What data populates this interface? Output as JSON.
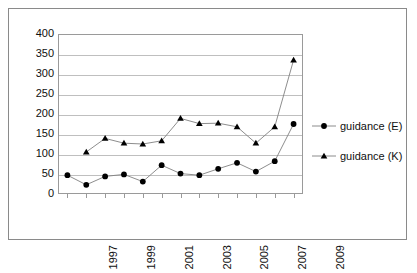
{
  "chart_data": {
    "type": "line",
    "title": "",
    "subtitle": "",
    "xlabel": "",
    "ylabel": "",
    "x": [
      1997,
      1998,
      1999,
      2000,
      2001,
      2002,
      2003,
      2004,
      2005,
      2006,
      2007,
      2008,
      2009
    ],
    "categories": [
      "1997",
      "1998",
      "1999",
      "2000",
      "2001",
      "2002",
      "2003",
      "2004",
      "2005",
      "2006",
      "2007",
      "2008",
      "2009"
    ],
    "xtick_labels": [
      "1997",
      "1999",
      "2001",
      "2003",
      "2005",
      "2007",
      "2009"
    ],
    "xtick_values": [
      1997,
      1999,
      2001,
      2003,
      2005,
      2007,
      2009
    ],
    "ytick_labels": [
      "0",
      "50",
      "100",
      "150",
      "200",
      "250",
      "300",
      "350",
      "400"
    ],
    "ytick_values": [
      0,
      50,
      100,
      150,
      200,
      250,
      300,
      350,
      400
    ],
    "ylim": [
      0,
      400
    ],
    "xlim": [
      1996.5,
      2009.5
    ],
    "grid": "horizontal",
    "legend_position": "right",
    "series": [
      {
        "name": "guidance (E)",
        "marker": "circle",
        "color": "#000000",
        "line_color": "#808080",
        "values": [
          47,
          23,
          44,
          49,
          31,
          72,
          51,
          47,
          63,
          78,
          56,
          82,
          175
        ]
      },
      {
        "name": "guidance (K)",
        "marker": "triangle",
        "color": "#000000",
        "line_color": "#808080",
        "values": [
          null,
          105,
          139,
          127,
          125,
          133,
          189,
          176,
          177,
          168,
          127,
          168,
          335
        ]
      }
    ]
  },
  "legend": {
    "items": [
      {
        "label": "guidance (E)",
        "marker": "circle-marker"
      },
      {
        "label": "guidance (K)",
        "marker": "triangle-marker"
      }
    ]
  },
  "colors": {
    "frame": "#8a8a8a",
    "gridline": "#bfbfbf",
    "axis": "#9a9a9a",
    "marker": "#000000",
    "line": "#808080",
    "text": "#101010",
    "background": "#ffffff"
  }
}
